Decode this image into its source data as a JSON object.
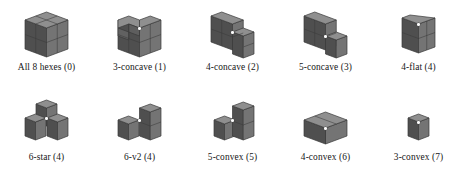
{
  "figure": {
    "colors": {
      "face_top": "#8f8f8f",
      "face_left": "#4f4f4f",
      "face_right": "#747474",
      "edge": "#3a3a3a",
      "background": "#ffffff",
      "text": "#161616",
      "vertex_dot": "#fbfbfb"
    },
    "rows": [
      {
        "items": [
          {
            "label": "All 8 hexes (0)",
            "name": "all-8-hexes",
            "count": 8,
            "index": 0,
            "shape": "all8"
          },
          {
            "label": "3-concave (1)",
            "name": "3-concave",
            "count": 7,
            "index": 1,
            "shape": "concave3"
          },
          {
            "label": "4-concave (2)",
            "name": "4-concave",
            "count": 6,
            "index": 2,
            "shape": "concave4"
          },
          {
            "label": "5-concave (3)",
            "name": "5-concave",
            "count": 5,
            "index": 3,
            "shape": "concave5"
          },
          {
            "label": "4-flat (4)",
            "name": "4-flat",
            "count": 4,
            "index": 4,
            "shape": "flat4"
          }
        ]
      },
      {
        "items": [
          {
            "label": "6-star (4)",
            "name": "6-star",
            "count": 4,
            "index": 4,
            "shape": "star6"
          },
          {
            "label": "6-v2 (4)",
            "name": "6-v2",
            "count": 4,
            "index": 4,
            "shape": "v2_6"
          },
          {
            "label": "5-convex (5)",
            "name": "5-convex",
            "count": 3,
            "index": 5,
            "shape": "convex5"
          },
          {
            "label": "4-convex (6)",
            "name": "4-convex",
            "count": 2,
            "index": 6,
            "shape": "convex4"
          },
          {
            "label": "3-convex (7)",
            "name": "3-convex",
            "count": 1,
            "index": 7,
            "shape": "convex3"
          }
        ]
      }
    ]
  }
}
